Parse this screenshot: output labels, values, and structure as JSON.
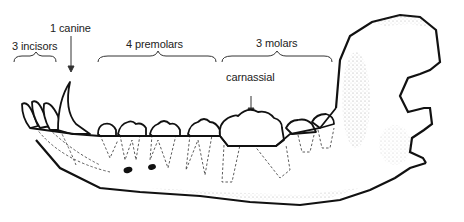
{
  "diagram": {
    "labels": {
      "incisors": "3 incisors",
      "canine": "1 canine",
      "premolars": "4 premolars",
      "molars": "3 molars",
      "carnassial": "carnassial"
    },
    "colors": {
      "outline": "#111111",
      "root_dashes": "#333333",
      "stipple": "#888888",
      "background": "#ffffff"
    }
  }
}
